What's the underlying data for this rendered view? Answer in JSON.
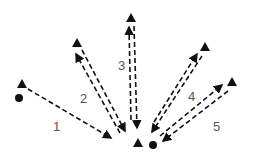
{
  "diagram": {
    "labels": [
      "1",
      "2",
      "3",
      "4",
      "5"
    ],
    "colors": {
      "line": "#111111",
      "label": "#555555",
      "background": "#ffffff"
    }
  }
}
